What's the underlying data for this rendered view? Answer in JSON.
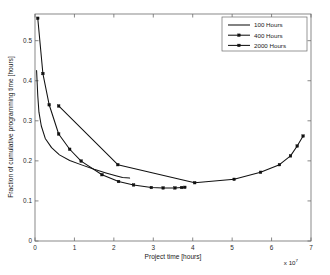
{
  "chart_data": {
    "type": "line",
    "title": "",
    "xlabel": "Project  time [hours]",
    "ylabel": "Fraction of cumulative programming time [hours]",
    "x_exponent_label": "x 10",
    "x_exponent_power": "7",
    "x_scale_multiplier": 10000000.0,
    "xlim": [
      0,
      7
    ],
    "ylim": [
      0,
      0.5666
    ],
    "xticks": [
      0,
      1,
      2,
      3,
      4,
      5,
      6,
      7
    ],
    "xticklabels": [
      "0",
      "1",
      "2",
      "3",
      "4",
      "5",
      "6",
      "7"
    ],
    "yticks": [
      0,
      0.1,
      0.2,
      0.3,
      0.4,
      0.5
    ],
    "yticklabels": [
      "0",
      "0.1",
      "0.2",
      "0.3",
      "0.4",
      "0.5"
    ],
    "grid": false,
    "legend_position": "upper right",
    "legend_entries": [
      "100 Hours",
      "400 Hours",
      "2000 Hours"
    ],
    "series": [
      {
        "name": "100 Hours",
        "marker": "none",
        "points": [
          [
            0.04,
            0.4255
          ],
          [
            0.07,
            0.363
          ],
          [
            0.1,
            0.3215
          ],
          [
            0.16,
            0.287
          ],
          [
            0.26,
            0.256
          ],
          [
            0.42,
            0.233
          ],
          [
            0.62,
            0.215
          ],
          [
            0.88,
            0.201
          ],
          [
            1.18,
            0.19
          ],
          [
            1.5,
            0.179
          ],
          [
            1.8,
            0.17
          ],
          [
            2.05,
            0.163
          ],
          [
            2.22,
            0.1585
          ],
          [
            2.4,
            0.157
          ]
        ]
      },
      {
        "name": "400 Hours",
        "marker": "square",
        "points": [
          [
            0.07,
            0.556
          ],
          [
            0.2,
            0.418
          ],
          [
            0.36,
            0.34
          ],
          [
            0.6,
            0.267
          ],
          [
            0.88,
            0.229
          ],
          [
            1.17,
            0.1995
          ],
          [
            1.7,
            0.1655
          ],
          [
            2.12,
            0.1485
          ],
          [
            2.5,
            0.14
          ],
          [
            2.95,
            0.1335
          ],
          [
            3.25,
            0.1325
          ],
          [
            3.55,
            0.1325
          ],
          [
            3.72,
            0.1335
          ],
          [
            3.8,
            0.134
          ]
        ]
      },
      {
        "name": "2000 Hours",
        "marker": "square",
        "points": [
          [
            0.6,
            0.337
          ],
          [
            2.1,
            0.1905
          ],
          [
            4.05,
            0.1455
          ],
          [
            5.05,
            0.154
          ],
          [
            5.72,
            0.1715
          ],
          [
            6.2,
            0.1905
          ],
          [
            6.48,
            0.2125
          ],
          [
            6.65,
            0.237
          ],
          [
            6.8,
            0.262
          ]
        ]
      }
    ]
  }
}
